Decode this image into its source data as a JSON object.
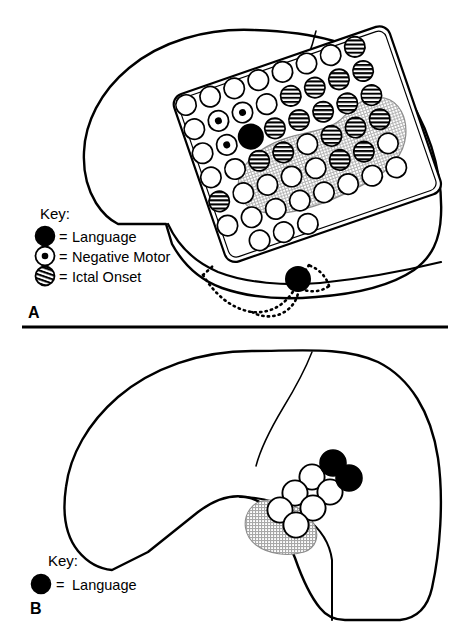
{
  "figure": {
    "divider": {
      "present": true,
      "y": 327,
      "x1": 22,
      "x2": 448
    }
  },
  "panels": [
    {
      "id": "A",
      "letter": "A",
      "description": "Pre-resection lateral brain with 8x6 subdural grid, subtemporal strip shown dotted",
      "key": {
        "title": "Key:",
        "items": [
          {
            "symbol": "filled-circle",
            "equals": "=",
            "label": "Language"
          },
          {
            "symbol": "dot-in-circle",
            "equals": "=",
            "label": "Negative Motor"
          },
          {
            "symbol": "striped-circle",
            "equals": "=",
            "label": "Ictal Onset"
          }
        ]
      },
      "grid": {
        "columns": 8,
        "rows": 6,
        "rotation_deg": -19,
        "cell_pitch": 25.5,
        "electrode_radius": 10.2,
        "types": [
          [
            "plain",
            "plain",
            "plain",
            "plain",
            "plain",
            "plain",
            "plain",
            "striped"
          ],
          [
            "plain",
            "negmotor",
            "negmotor",
            "plain",
            "striped",
            "striped",
            "striped",
            "striped"
          ],
          [
            "plain",
            "negmotor",
            "language",
            "striped",
            "striped",
            "striped",
            "striped",
            "striped"
          ],
          [
            "plain",
            "plain",
            "striped",
            "striped",
            "plain",
            "striped",
            "striped",
            "striped"
          ],
          [
            "striped",
            "plain",
            "plain",
            "plain",
            "plain",
            "striped",
            "striped",
            "plain"
          ],
          [
            "plain",
            "plain",
            "plain",
            "plain",
            "plain",
            "plain",
            "plain",
            "plain"
          ]
        ]
      },
      "shaded_region": {
        "present": true,
        "label": "resection zone shading",
        "color": "#c9c9c9"
      },
      "extra_electrodes": [
        {
          "type": "language",
          "location": "subtemporal strip"
        }
      ]
    },
    {
      "id": "B",
      "letter": "B",
      "description": "Post-resection lateral brain with temporal lobectomy cavity and remaining electrodes",
      "key": {
        "title": "Key:",
        "items": [
          {
            "symbol": "filled-circle",
            "equals": "=",
            "label": "Language"
          }
        ]
      },
      "electrodes": [
        {
          "type": "language",
          "x": 333,
          "y": 463
        },
        {
          "type": "language",
          "x": 348,
          "y": 477
        },
        {
          "type": "plain",
          "x": 312,
          "y": 477
        },
        {
          "type": "plain",
          "x": 330,
          "y": 492
        },
        {
          "type": "plain",
          "x": 295,
          "y": 493
        },
        {
          "type": "plain",
          "x": 313,
          "y": 508
        },
        {
          "type": "plain",
          "x": 280,
          "y": 510
        },
        {
          "type": "plain",
          "x": 296,
          "y": 525
        }
      ],
      "shaded_region": {
        "present": true,
        "color": "#c9c9c9"
      }
    }
  ],
  "colors": {
    "ink": "#000000",
    "paper": "#ffffff",
    "shade": "#c9c9c9",
    "shade_edge": "#9a9a9a"
  },
  "symbols": {
    "filled_circle": "filled-circle-icon",
    "dot_in_circle": "dot-in-circle-icon",
    "striped_circle": "striped-circle-icon",
    "plain_circle": "plain-circle-icon"
  }
}
